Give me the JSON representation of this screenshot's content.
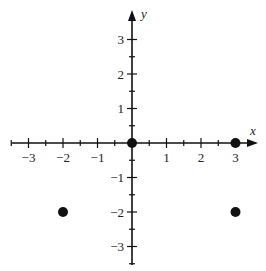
{
  "chart_data": {
    "type": "scatter",
    "title": "",
    "xlabel": "x",
    "ylabel": "y",
    "xlim": [
      -3.5,
      3.5
    ],
    "ylim": [
      -3.5,
      3.5
    ],
    "grid": false,
    "x_ticks": [
      -3,
      -2,
      -1,
      1,
      2,
      3
    ],
    "y_ticks": [
      -3,
      -2,
      -1,
      1,
      2,
      3
    ],
    "minor_tick_step": 0.5,
    "points": [
      {
        "x": 0,
        "y": 0
      },
      {
        "x": 3,
        "y": 0
      },
      {
        "x": -2,
        "y": -2
      },
      {
        "x": 3,
        "y": -2
      }
    ]
  },
  "layout": {
    "origin_px": [
      132,
      143
    ],
    "unit_px": 34.5,
    "x_axis_px": [
      12,
      258
    ],
    "y_axis_px": [
      10,
      265
    ],
    "color": "#111111"
  },
  "labels": {
    "x_axis": "x",
    "y_axis": "y",
    "x_tick_labels": [
      "−3",
      "−2",
      "−1",
      "1",
      "2",
      "3"
    ],
    "y_tick_labels": [
      "−3",
      "−2",
      "−1",
      "1",
      "2",
      "3"
    ]
  }
}
